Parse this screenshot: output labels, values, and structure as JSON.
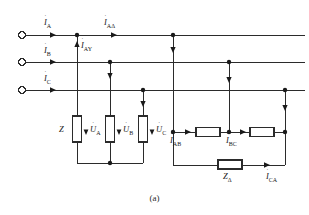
{
  "figure": {
    "caption": "(a)",
    "line_color": "#2b2b2b",
    "text_color": "#1a1a1a",
    "background": "#ffffff"
  },
  "terminals": [
    {
      "name": "terminal-a",
      "label_symbol": "I",
      "label_sub": "A",
      "has_dot": true,
      "x": 22,
      "y": 35
    },
    {
      "name": "terminal-b",
      "label_symbol": "I",
      "label_sub": "B",
      "has_dot": true,
      "x": 22,
      "y": 62
    },
    {
      "name": "terminal-c",
      "label_symbol": "I",
      "label_sub": "C",
      "has_dot": true,
      "x": 22,
      "y": 90
    }
  ],
  "labels": {
    "i_a": {
      "symbol": "I",
      "sub": "A",
      "dot": "˙",
      "x": 44,
      "y": 18
    },
    "i_b": {
      "symbol": "I",
      "sub": "B",
      "dot": "˙",
      "x": 44,
      "y": 46
    },
    "i_c": {
      "symbol": "I",
      "sub": "C",
      "dot": "˙",
      "x": 44,
      "y": 74
    },
    "i_a_delta": {
      "symbol": "I",
      "sub": "AΔ",
      "dot": "˙",
      "x": 104,
      "y": 18
    },
    "i_a_wye": {
      "symbol": "I",
      "sub": "AY",
      "dot": "˙",
      "x": 78,
      "y": 43
    },
    "z_wye": {
      "symbol": "Z",
      "sub": "",
      "dot": "",
      "x": 59,
      "y": 131
    },
    "u_a": {
      "symbol": "U",
      "sub": "A",
      "dot": "˙",
      "x": 84,
      "y": 131
    },
    "u_b": {
      "symbol": "U",
      "sub": "B",
      "dot": "˙",
      "x": 117,
      "y": 131
    },
    "u_c": {
      "symbol": "U",
      "sub": "C",
      "dot": "˙",
      "x": 150,
      "y": 131
    },
    "i_ab": {
      "symbol": "I",
      "sub": "AB",
      "dot": "˙",
      "x": 170,
      "y": 141
    },
    "i_bc": {
      "symbol": "I",
      "sub": "BC",
      "dot": "˙",
      "x": 229,
      "y": 141
    },
    "z_delta": {
      "symbol": "Z",
      "sub": "Δ",
      "dot": "",
      "x": 217,
      "y": 174
    },
    "i_ca": {
      "symbol": "I",
      "sub": "CA",
      "dot": "˙",
      "x": 266,
      "y": 174
    }
  },
  "components": {
    "wye_impedances": [
      {
        "name": "impedance-za",
        "x": 73,
        "y": 116,
        "w": 9,
        "h": 26
      },
      {
        "name": "impedance-zb",
        "x": 106,
        "y": 116,
        "w": 9,
        "h": 26
      },
      {
        "name": "impedance-zc",
        "x": 139,
        "y": 116,
        "w": 9,
        "h": 26
      }
    ],
    "delta_impedances": [
      {
        "name": "impedance-zab",
        "x": 196,
        "y": 128,
        "w": 24,
        "h": 9
      },
      {
        "name": "impedance-zbc",
        "x": 250,
        "y": 128,
        "w": 24,
        "h": 9
      },
      {
        "name": "impedance-zca",
        "x": 218,
        "y": 160,
        "w": 24,
        "h": 9
      }
    ]
  },
  "bus_lines": [
    {
      "name": "bus-line-a",
      "y": 35,
      "x1": 26,
      "x2": 305
    },
    {
      "name": "bus-line-b",
      "y": 62,
      "x1": 26,
      "x2": 305
    },
    {
      "name": "bus-line-c",
      "y": 90,
      "x1": 26,
      "x2": 305
    }
  ],
  "junction_nodes": [
    {
      "name": "node-a-wye-tap",
      "x": 77,
      "y": 35
    },
    {
      "name": "node-b-wye-tap",
      "x": 110,
      "y": 62
    },
    {
      "name": "node-c-wye-tap",
      "x": 143,
      "y": 90
    },
    {
      "name": "node-wye-neutral",
      "x": 110,
      "y": 163
    },
    {
      "name": "node-a-delta-tap",
      "x": 173,
      "y": 35
    },
    {
      "name": "node-b-delta-tap",
      "x": 229,
      "y": 62
    },
    {
      "name": "node-c-delta-tap",
      "x": 285,
      "y": 90
    },
    {
      "name": "node-delta-ab",
      "x": 173,
      "y": 132
    },
    {
      "name": "node-delta-bc",
      "x": 229,
      "y": 132
    },
    {
      "name": "node-delta-ca",
      "x": 285,
      "y": 132
    }
  ]
}
